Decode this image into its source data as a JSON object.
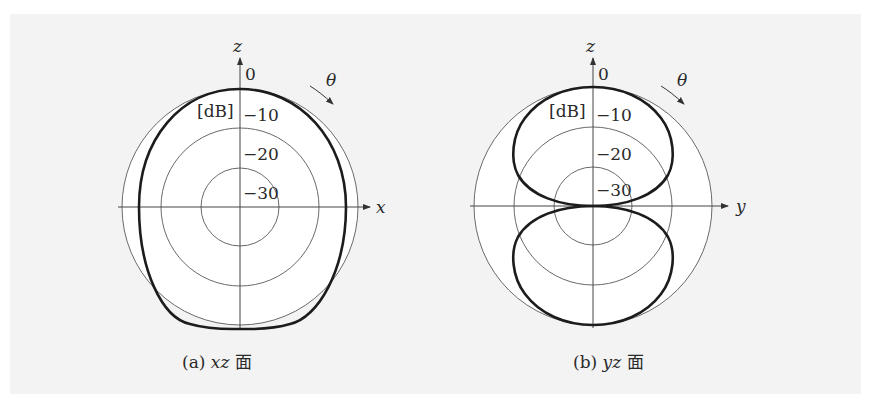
{
  "figure": {
    "panels": [
      {
        "id": "a",
        "caption_prefix": "(a)",
        "caption_plane": "xz",
        "caption_suffix": "面",
        "horizontal_axis_label": "x",
        "vertical_axis_label": "z",
        "angle_label": "θ",
        "unit_label": "[dB]",
        "ring_labels": [
          "0",
          "−10",
          "−20",
          "−30"
        ],
        "pattern": "near-omnidirectional ellipse (slightly narrower along x)"
      },
      {
        "id": "b",
        "caption_prefix": "(b)",
        "caption_plane": "yz",
        "caption_suffix": "面",
        "horizontal_axis_label": "y",
        "vertical_axis_label": "z",
        "angle_label": "θ",
        "unit_label": "[dB]",
        "ring_labels": [
          "0",
          "−10",
          "−20",
          "−30"
        ],
        "pattern": "figure-eight (two lobes along z, null along y)"
      }
    ],
    "colors": {
      "background": "#f3f3f3",
      "grid": "#6a6a6a",
      "pattern": "#1c1c1c"
    }
  }
}
